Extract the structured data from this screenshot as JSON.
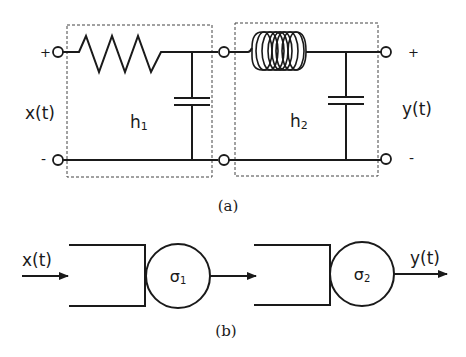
{
  "figure_a": {
    "caption": "(a)",
    "input_label": "x(t)",
    "output_label": "y(t)",
    "plus_left": "+",
    "minus_left": "-",
    "plus_right": "+",
    "minus_right": "-",
    "stage1": {
      "label": "h",
      "subscript": "1",
      "components": [
        "resistor",
        "capacitor"
      ]
    },
    "stage2": {
      "label": "h",
      "subscript": "2",
      "components": [
        "inductor",
        "capacitor"
      ]
    }
  },
  "figure_b": {
    "caption": "(b)",
    "input_label": "x(t)",
    "output_label": "y(t)",
    "block1": {
      "symbol": "σ",
      "subscript": "1"
    },
    "block2": {
      "symbol": "σ",
      "subscript": "2"
    }
  }
}
